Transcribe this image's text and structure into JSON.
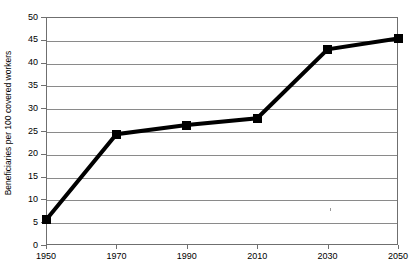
{
  "chart_data": {
    "type": "line",
    "title": "",
    "xlabel": "",
    "ylabel": "Beneficiaries per 100 covered workers",
    "categories": [
      "1950",
      "1970",
      "1990",
      "2010",
      "2030",
      "2050"
    ],
    "values": [
      5.5,
      24.3,
      26.3,
      27.8,
      42.9,
      45.3
    ],
    "series": [
      {
        "name": "Beneficiaries per 100 covered workers",
        "values": [
          5.5,
          24.3,
          26.3,
          27.8,
          42.9,
          45.3
        ]
      }
    ],
    "ylim": [
      0,
      50
    ],
    "ytick_labels": [
      "0",
      "5",
      "10",
      "15",
      "20",
      "25",
      "30",
      "35",
      "40",
      "45",
      "50"
    ],
    "ytick_values": [
      0,
      5,
      10,
      15,
      20,
      25,
      30,
      35,
      40,
      45,
      50
    ],
    "xtick_labels": [
      "1950",
      "1970",
      "1990",
      "2010",
      "2030",
      "2050"
    ],
    "grid": "horizontal",
    "legend": "none",
    "colors": {
      "line": "#000000",
      "marker": "#000000",
      "grid": "#8a8a8a",
      "frame": "#6f6f6f",
      "background": "#ffffff",
      "text": "#000000"
    }
  }
}
